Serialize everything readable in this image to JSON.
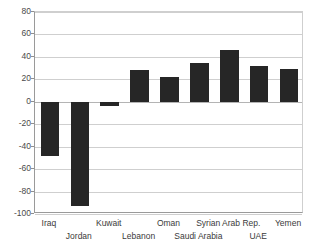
{
  "chart_data": {
    "type": "bar",
    "title": "",
    "subtitle": "",
    "xlabel": "",
    "ylabel": "",
    "categories": [
      "Iraq",
      "Jordan",
      "Kuwait",
      "Lebanon",
      "Oman",
      "Saudi Arabia",
      "Syrian Arab Rep.",
      "UAE",
      "Yemen"
    ],
    "values": [
      -48,
      -93,
      -4,
      28,
      22,
      35,
      46,
      32,
      29
    ],
    "ylim": [
      -100,
      80
    ],
    "ytick_step": 20,
    "yticks": [
      80,
      60,
      40,
      20,
      0,
      -20,
      -40,
      -60,
      -80,
      -100
    ],
    "ytick_labels": [
      "80",
      "60",
      "40",
      "20",
      "0",
      "-20",
      "-40",
      "-60",
      "-80",
      "-100"
    ],
    "grid": true,
    "grid_axis": "y",
    "legend": false,
    "legend_position": "none",
    "bar_color": "#262626",
    "grid_color": "#cfcfcf",
    "axis_color": "#9a9a9a",
    "background_color": "#ffffff",
    "xlabel_rows": [
      0,
      1,
      0,
      1,
      0,
      1,
      0,
      1,
      0
    ],
    "annotations": []
  }
}
